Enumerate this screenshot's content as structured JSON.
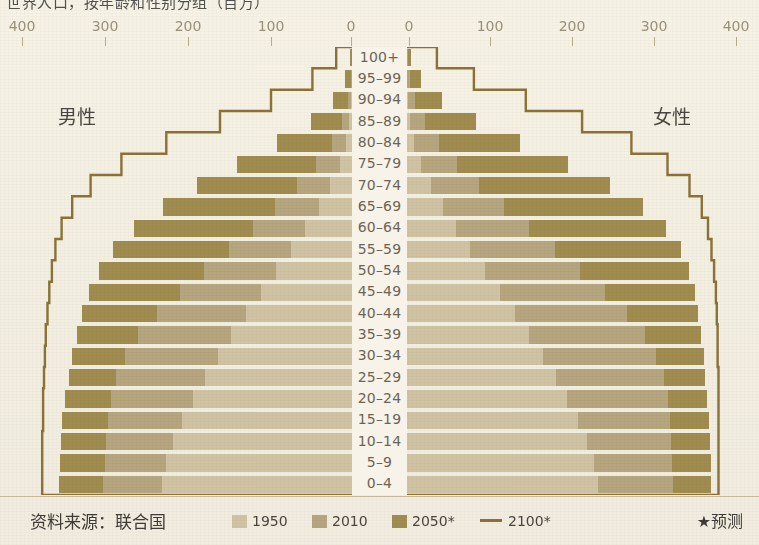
{
  "title_clipped": "世界人口，按年龄和性别分组（百万）",
  "axis": {
    "left_ticks": [
      400,
      300,
      200,
      100,
      0
    ],
    "right_ticks": [
      0,
      100,
      200,
      300,
      400
    ],
    "max": 400,
    "unit": "百万"
  },
  "labels": {
    "male": "男性",
    "female": "女性"
  },
  "footer": {
    "source": "资料来源：联合国",
    "footnote": "★预测",
    "legend": [
      {
        "label": "1950",
        "color": "#cfc3a4",
        "type": "swatch"
      },
      {
        "label": "2010",
        "color": "#b5a67f",
        "type": "swatch"
      },
      {
        "label": "2050*",
        "color": "#a08c4f",
        "type": "swatch"
      },
      {
        "label": "2100*",
        "color": "#8a7136",
        "type": "line"
      }
    ]
  },
  "chart_data": {
    "type": "bar",
    "subtype": "population-pyramid",
    "title": "世界人口，按年龄和性别分组（百万）",
    "xlabel": "",
    "ylabel": "",
    "xlim": [
      -400,
      400
    ],
    "grid": false,
    "legend_position": "bottom",
    "categories": [
      "100+",
      "95–99",
      "90–94",
      "85–89",
      "80–84",
      "75–79",
      "70–74",
      "65–69",
      "60–64",
      "55–59",
      "50–54",
      "45–49",
      "40–44",
      "35–39",
      "30–34",
      "25–29",
      "20–24",
      "15–19",
      "10–14",
      "5–9",
      "0–4"
    ],
    "series": [
      {
        "name": "1950",
        "color": "#cfc3a4",
        "male": [
          0,
          0,
          1,
          3,
          7,
          14,
          25,
          38,
          53,
          69,
          86,
          103,
          120,
          137,
          152,
          167,
          181,
          193,
          203,
          211,
          216
        ],
        "female": [
          0,
          0,
          1,
          3,
          8,
          16,
          27,
          41,
          56,
          72,
          89,
          106,
          123,
          139,
          154,
          169,
          182,
          194,
          204,
          212,
          217
        ]
      },
      {
        "name": "2010",
        "color": "#b5a67f",
        "male": [
          0,
          1,
          4,
          11,
          23,
          41,
          63,
          88,
          113,
          140,
          168,
          196,
          222,
          243,
          258,
          268,
          274,
          277,
          279,
          281,
          283
        ],
        "female": [
          1,
          3,
          9,
          20,
          36,
          57,
          82,
          110,
          139,
          168,
          197,
          225,
          250,
          270,
          283,
          292,
          297,
          299,
          300,
          301,
          302
        ]
      },
      {
        "name": "2050*",
        "color": "#a08c4f",
        "male": [
          2,
          8,
          22,
          47,
          85,
          131,
          176,
          215,
          248,
          272,
          288,
          299,
          307,
          313,
          318,
          322,
          326,
          329,
          331,
          332,
          333
        ],
        "female": [
          5,
          16,
          40,
          78,
          128,
          183,
          231,
          268,
          294,
          311,
          321,
          327,
          331,
          334,
          337,
          339,
          341,
          343,
          344,
          345,
          346
        ]
      },
      {
        "name": "2100*",
        "color": "#8a7136",
        "type": "step-outline",
        "male": [
          18,
          45,
          92,
          150,
          211,
          262,
          297,
          318,
          330,
          337,
          341,
          344,
          346,
          348,
          349,
          350,
          351,
          351,
          352,
          352,
          352
        ],
        "female": [
          34,
          76,
          135,
          199,
          255,
          296,
          321,
          335,
          342,
          346,
          349,
          351,
          352,
          353,
          353,
          354,
          354,
          354,
          354,
          354,
          354
        ]
      }
    ]
  }
}
